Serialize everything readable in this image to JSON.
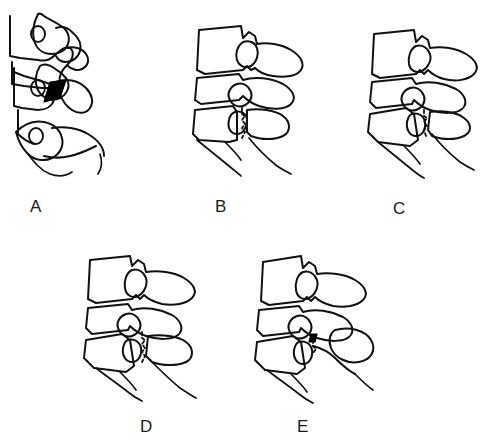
{
  "figure": {
    "background_color": "#ffffff",
    "line_color": "#111111",
    "label_color": "#1a1a1a",
    "width": 474,
    "height": 448,
    "panel_count": 5
  },
  "panels": [
    {
      "id": "panel-a",
      "label": "A",
      "label_x": 30,
      "label_y": 198,
      "art_x": 8,
      "art_y": 6,
      "art_w": 150,
      "art_h": 175,
      "region": "cervical",
      "vertebra_count": 3,
      "has_filled_wedge": true,
      "has_fracture_line": false,
      "has_free_fragment": false,
      "foramen_count": 3
    },
    {
      "id": "panel-b",
      "label": "B",
      "label_x": 215,
      "label_y": 198,
      "art_x": 185,
      "art_y": 22,
      "art_w": 130,
      "art_h": 158,
      "region": "thoracolumbar",
      "vertebra_count": 3,
      "has_filled_wedge": false,
      "has_fracture_line": true,
      "has_free_fragment": false,
      "foramen_count": 0
    },
    {
      "id": "panel-c",
      "label": "C",
      "label_x": 393,
      "label_y": 198,
      "art_x": 368,
      "art_y": 28,
      "art_w": 122,
      "art_h": 155,
      "region": "thoracolumbar",
      "vertebra_count": 3,
      "has_filled_wedge": false,
      "has_fracture_line": true,
      "has_free_fragment": false,
      "foramen_count": 0
    },
    {
      "id": "panel-d",
      "label": "D",
      "label_x": 140,
      "label_y": 418,
      "art_x": 82,
      "art_y": 252,
      "art_w": 135,
      "art_h": 150,
      "region": "thoracolumbar",
      "vertebra_count": 3,
      "has_filled_wedge": false,
      "has_fracture_line": true,
      "has_free_fragment": false,
      "foramen_count": 0
    },
    {
      "id": "panel-e",
      "label": "E",
      "label_x": 295,
      "label_y": 418,
      "art_x": 255,
      "art_y": 252,
      "art_w": 140,
      "art_h": 150,
      "region": "thoracolumbar",
      "vertebra_count": 3,
      "has_filled_wedge": true,
      "has_fracture_line": true,
      "has_free_fragment": true,
      "foramen_count": 0
    }
  ]
}
